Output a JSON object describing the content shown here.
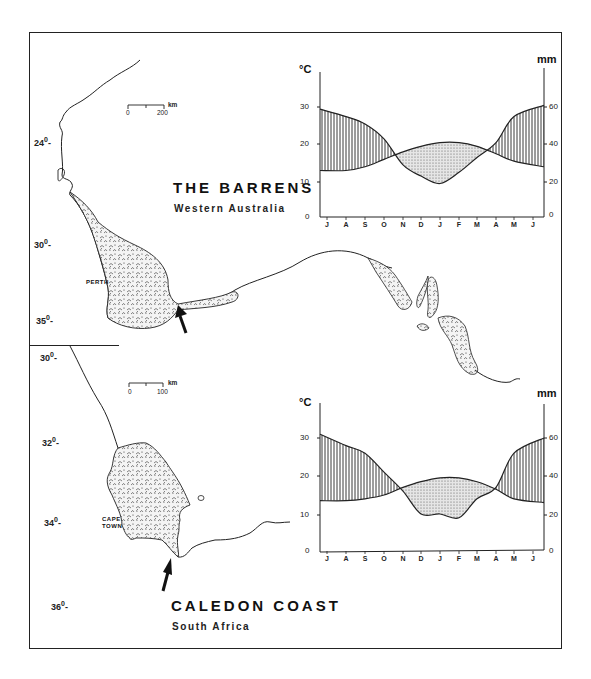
{
  "figure": {
    "panels": [
      {
        "id": "barrens",
        "title": "THE BARRENS",
        "subtitle": "Western Australia",
        "city": "PERTH",
        "scale_bar": {
          "start": "0",
          "end": "200",
          "unit": "km"
        },
        "latitudes": [
          "24",
          "30",
          "35"
        ],
        "degree": "0"
      },
      {
        "id": "caledon",
        "title": "CALEDON COAST",
        "subtitle": "South Africa",
        "city_line1": "CAPE",
        "city_line2": "TOWN",
        "scale_bar": {
          "start": "0",
          "end": "100",
          "unit": "km"
        },
        "latitudes": [
          "30",
          "32",
          "34",
          "36"
        ],
        "degree": "0"
      }
    ],
    "axis_units": {
      "left": "°C",
      "right": "mm"
    },
    "left_ticks": [
      "0",
      "10",
      "20",
      "30"
    ],
    "right_ticks": [
      "0",
      "20",
      "40",
      "60"
    ],
    "months": [
      "J",
      "A",
      "S",
      "O",
      "N",
      "D",
      "J",
      "F",
      "M",
      "A",
      "M",
      "J"
    ]
  },
  "chart_data": [
    {
      "type": "line",
      "title": "THE BARRENS — Western Australia (climate diagram)",
      "categories": [
        "J",
        "A",
        "S",
        "O",
        "N",
        "D",
        "J",
        "F",
        "M",
        "A",
        "M",
        "J"
      ],
      "series": [
        {
          "name": "Mean temperature (°C)",
          "axis": "left",
          "values": [
            12.5,
            12.5,
            13.5,
            15.5,
            17.5,
            19,
            20,
            20,
            19,
            17,
            15,
            13.5
          ]
        },
        {
          "name": "Precipitation (mm)",
          "axis": "right",
          "values": [
            58,
            54,
            50,
            42,
            28,
            22,
            18,
            24,
            32,
            40,
            54,
            60
          ]
        }
      ],
      "xlabel": "",
      "ylabel": "°C",
      "y2label": "mm",
      "ylim": [
        0,
        35
      ],
      "y2lim": [
        0,
        70
      ],
      "fill": {
        "humid_period": "vertical hatching (precipitation above temperature)",
        "dry_period": "stippled (temperature above precipitation)"
      }
    },
    {
      "type": "line",
      "title": "CALEDON COAST — South Africa (climate diagram)",
      "categories": [
        "J",
        "A",
        "S",
        "O",
        "N",
        "D",
        "J",
        "F",
        "M",
        "A",
        "M",
        "J"
      ],
      "series": [
        {
          "name": "Mean temperature (°C)",
          "axis": "left",
          "values": [
            13.5,
            13.5,
            14,
            15,
            17,
            18.5,
            19.5,
            19.5,
            18.5,
            16.5,
            14,
            13
          ]
        },
        {
          "name": "Precipitation (mm)",
          "axis": "right",
          "values": [
            62,
            56,
            52,
            42,
            32,
            20,
            20,
            18,
            28,
            34,
            52,
            60
          ]
        }
      ],
      "xlabel": "",
      "ylabel": "°C",
      "y2label": "mm",
      "ylim": [
        0,
        35
      ],
      "y2lim": [
        0,
        70
      ],
      "fill": {
        "humid_period": "vertical hatching (precipitation above temperature)",
        "dry_period": "stippled (temperature above precipitation)"
      }
    }
  ]
}
